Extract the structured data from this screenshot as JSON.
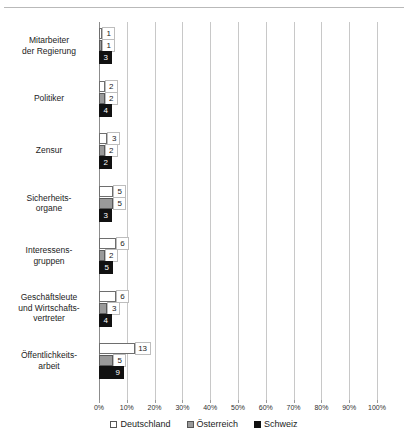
{
  "chart_data": {
    "type": "bar",
    "orientation": "horizontal",
    "title": "",
    "xlabel": "",
    "ylabel": "",
    "xlim": [
      0,
      100
    ],
    "xunit": "%",
    "grid": true,
    "legend_position": "bottom",
    "categories": [
      "Mitarbeiter der Regierung",
      "Politiker",
      "Zensur",
      "Sicherheitsorgane",
      "Interessensgruppen",
      "Geschäftsleute und Wirtschaftsvertreter",
      "Öffentlichkeitsarbeit"
    ],
    "category_lines": [
      [
        "Mitarbeiter",
        "der Regierung"
      ],
      [
        "Politiker"
      ],
      [
        "Zensur"
      ],
      [
        "Sicherheits-",
        "organe"
      ],
      [
        "Interessens-",
        "gruppen"
      ],
      [
        "Geschäftsleute",
        "und Wirtschafts-",
        "vertreter"
      ],
      [
        "Öffentlichkeits-",
        "arbeit"
      ]
    ],
    "series": [
      {
        "name": "Deutschland",
        "color": "#ffffff",
        "values": [
          1,
          2,
          3,
          5,
          6,
          6,
          13
        ]
      },
      {
        "name": "Österreich",
        "color": "#9a9a9a",
        "values": [
          1,
          2,
          2,
          5,
          2,
          3,
          5
        ]
      },
      {
        "name": "Schweiz",
        "color": "#111111",
        "values": [
          3,
          4,
          2,
          3,
          5,
          4,
          9
        ]
      }
    ],
    "tick_labels": [
      "0%",
      "10%",
      "20%",
      "30%",
      "40%",
      "50%",
      "60%",
      "70%",
      "80%",
      "90%",
      "100%"
    ],
    "tick_values": [
      0,
      10,
      20,
      30,
      40,
      50,
      60,
      70,
      80,
      90,
      100
    ]
  },
  "legend": {
    "items": [
      {
        "label": "Deutschland",
        "swatch": "white-square-icon"
      },
      {
        "label": "Österreich",
        "swatch": "gray-square-icon"
      },
      {
        "label": "Schweiz",
        "swatch": "black-square-icon"
      }
    ]
  }
}
